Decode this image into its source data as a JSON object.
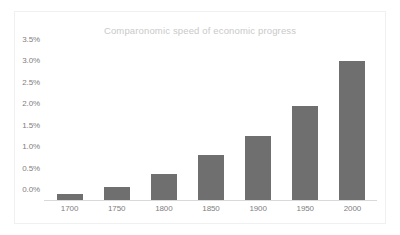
{
  "chart_data": {
    "type": "bar",
    "title": "Comparonomic speed of economic progress",
    "subtitle": "",
    "xlabel": "",
    "ylabel": "",
    "categories": [
      "1700",
      "1750",
      "1800",
      "1850",
      "1900",
      "1950",
      "2000"
    ],
    "values": [
      0.15,
      0.3,
      0.6,
      1.05,
      1.5,
      2.2,
      3.25
    ],
    "value_format": "percent",
    "ylim": [
      0.0,
      3.5
    ],
    "ytick_values": [
      3.5,
      3.0,
      2.5,
      2.0,
      1.5,
      1.0,
      0.5,
      0.0
    ],
    "ytick_labels": [
      "3.5%",
      "3.0%",
      "2.5%",
      "2.0%",
      "1.5%",
      "1.0%",
      "0.5%",
      "0.0%"
    ],
    "grid": false,
    "legend": false,
    "legend_position": "none",
    "bar_color": "#706F6F",
    "title_color": "#C9C9C9",
    "tick_label_color": "#808080",
    "axis_line_color": "#D9D9D9",
    "plot_background": "#FFFFFF",
    "frame_border_color": "#F0F0F0"
  }
}
